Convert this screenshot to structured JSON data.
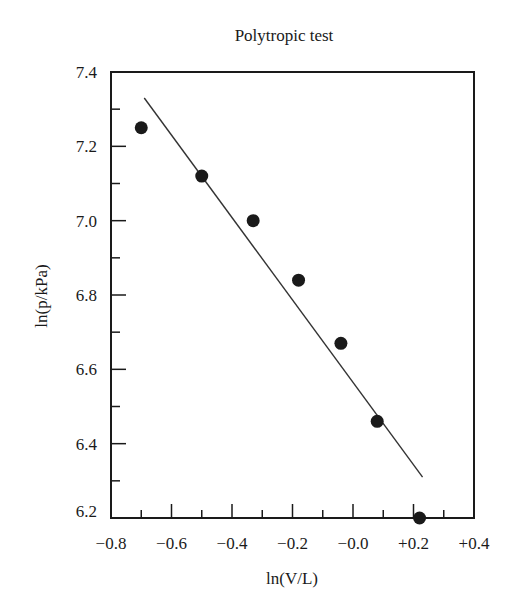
{
  "chart_data": {
    "type": "scatter",
    "title": "Polytropic test",
    "xlabel": "ln(V/L)",
    "ylabel": "ln(p/kPa)",
    "xlim": [
      -0.8,
      0.4
    ],
    "ylim": [
      6.2,
      7.4
    ],
    "x_ticks": [
      -0.8,
      -0.6,
      -0.4,
      -0.2,
      0.0,
      0.2,
      0.4
    ],
    "x_tick_labels": [
      "−0.8",
      "−0.6",
      "−0.4",
      "−0.2",
      "−0.0",
      "+0.2",
      "+0.4"
    ],
    "x_minor_ticks": [
      -0.7,
      -0.5,
      -0.3,
      -0.1,
      0.1,
      0.3
    ],
    "y_ticks": [
      6.2,
      6.4,
      6.6,
      6.8,
      7.0,
      7.2,
      7.4
    ],
    "y_tick_labels": [
      "6.2",
      "6.4",
      "6.6",
      "6.8",
      "7.0",
      "7.2",
      "7.4"
    ],
    "y_minor_ticks": [
      6.3,
      6.5,
      6.7,
      6.9,
      7.1,
      7.3
    ],
    "grid": false,
    "legend": null,
    "series": [
      {
        "name": "measured",
        "kind": "points",
        "color": "#1a1a1a",
        "x": [
          -0.7,
          -0.5,
          -0.33,
          -0.18,
          -0.04,
          0.08,
          0.22
        ],
        "y": [
          7.25,
          7.12,
          7.0,
          6.84,
          6.67,
          6.46,
          6.2
        ]
      },
      {
        "name": "linear fit",
        "kind": "line",
        "color": "#333333",
        "x": [
          -0.69,
          0.23
        ],
        "y": [
          7.33,
          6.31
        ]
      }
    ]
  }
}
